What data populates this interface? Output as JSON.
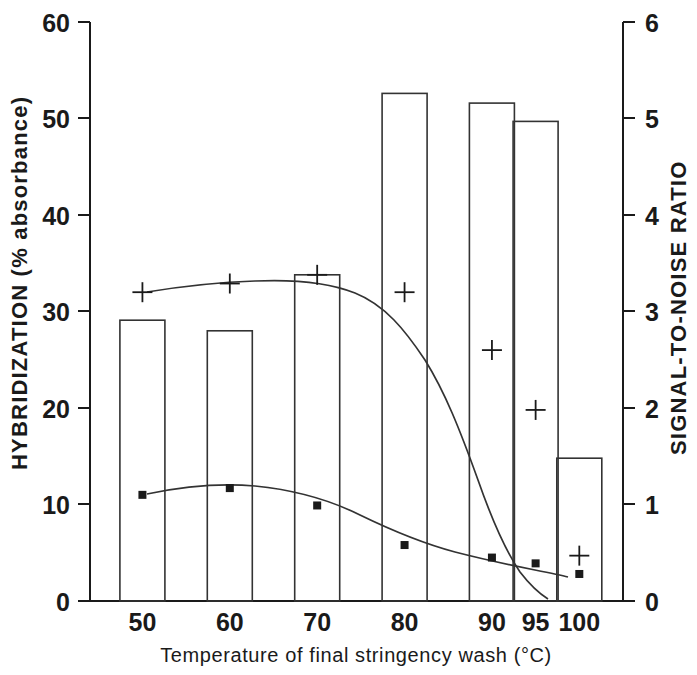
{
  "chart_data": {
    "type": "bar",
    "title": "",
    "subtitle": "",
    "xlabel": "Temperature of final stringency wash (°C)",
    "ylabel": "HYBRIDIZATION (% absorbance)",
    "y2label": "SIGNAL-TO-NOISE RATIO",
    "categories": [
      "50",
      "60",
      "70",
      "80",
      "90",
      "95",
      "100"
    ],
    "x_positions_units": [
      50,
      60,
      70,
      80,
      90,
      95,
      100
    ],
    "ylim": [
      0,
      60
    ],
    "y2lim": [
      0,
      6
    ],
    "yticks": [
      "0",
      "10",
      "20",
      "30",
      "40",
      "50",
      "60"
    ],
    "y2ticks": [
      "0",
      "1",
      "2",
      "3",
      "4",
      "5",
      "6"
    ],
    "grid": false,
    "legend": "none",
    "series": [
      {
        "name": "HYBRIDIZATION (% absorbance)",
        "kind": "bar",
        "axis": "left",
        "values": [
          29.1,
          28.0,
          33.8,
          52.6,
          51.6,
          49.7,
          14.8
        ]
      },
      {
        "name": "Signal-to-noise ratio (plus markers)",
        "kind": "line-plus",
        "axis": "left",
        "marker": "plus",
        "values": [
          32.0,
          32.9,
          33.8,
          32.0,
          26.0,
          19.8,
          4.7
        ]
      },
      {
        "name": "Background (square markers)",
        "kind": "line-square",
        "axis": "left",
        "marker": "square",
        "values": [
          11.0,
          11.7,
          9.9,
          5.8,
          4.5,
          3.9,
          2.8
        ]
      }
    ]
  },
  "axes": {
    "left_title": "HYBRIDIZATION (% absorbance)",
    "right_title": "SIGNAL-TO-NOISE RATIO",
    "bottom_title": "Temperature of final stringency wash (°C)",
    "left_ticks": [
      "60",
      "50",
      "40",
      "30",
      "20",
      "10",
      "0"
    ],
    "right_ticks": [
      "6",
      "5",
      "4",
      "3",
      "2",
      "1",
      "0"
    ],
    "bottom_ticks": [
      "50",
      "60",
      "70",
      "80",
      "90",
      "95",
      "100"
    ]
  },
  "colors": {
    "ink": "#1a1a1a",
    "line": "#333333",
    "background": "#ffffff"
  }
}
